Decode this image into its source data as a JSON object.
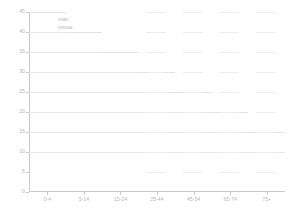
{
  "chart_data": {
    "type": "line",
    "title": "",
    "xlabel": "",
    "ylabel": "",
    "categories": [
      "0-4",
      "5-14",
      "15-24",
      "25-44",
      "45-54",
      "65-74",
      "75+"
    ],
    "ylim": [
      0,
      45
    ],
    "yticks": [
      0,
      5,
      10,
      15,
      20,
      25,
      30,
      35,
      40,
      45
    ],
    "grid": true,
    "legend_position": "top-left",
    "series": [
      {
        "name": "man",
        "color": "#e2e2e6",
        "values": [
          45,
          40,
          35,
          30,
          25,
          20,
          15
        ]
      },
      {
        "name": "vrouw",
        "color": "#e8e8ec",
        "values": [
          40,
          35,
          30,
          25,
          20,
          15,
          10
        ]
      }
    ]
  },
  "legend": {
    "items": [
      {
        "label": "man"
      },
      {
        "label": "vrouw"
      }
    ]
  },
  "axes": {
    "y_tick_labels": [
      "45",
      "40",
      "35",
      "30",
      "25",
      "20",
      "15",
      "10",
      "5",
      "0"
    ],
    "x_tick_labels": [
      "0-4",
      "5-14",
      "15-24",
      "25-44",
      "45-54",
      "65-74",
      "75+"
    ]
  }
}
